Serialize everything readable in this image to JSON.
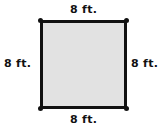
{
  "figure": {
    "shape": "square",
    "fill_color": "#e2e2e2",
    "border_color": "#111111",
    "labels": {
      "top": "8 ft.",
      "bottom": "8 ft.",
      "left": "8 ft.",
      "right": "8 ft."
    }
  }
}
